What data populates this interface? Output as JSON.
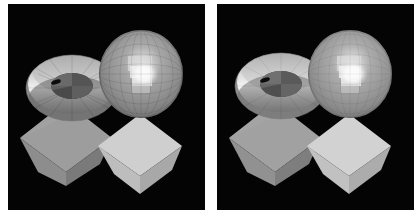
{
  "figure": {
    "background_color": "#ffffff",
    "panel_background_color": "#040404",
    "panel_count": 2,
    "width": 420,
    "height": 221
  },
  "panels": [
    {
      "id": "panel-left",
      "name": "left-render",
      "label": "",
      "x": 8,
      "y": 4,
      "width": 197,
      "height": 206,
      "background": "#040404",
      "shading": "flat-faceted",
      "objects": [
        {
          "name": "torus",
          "label": "torus",
          "center_x": 64,
          "center_y": 84,
          "outer_rx": 46,
          "outer_ry": 33,
          "inner_rx": 21,
          "inner_ry": 13,
          "facet_count": 16,
          "base_color": "#8e8e8e",
          "highlight_color": "#f2f2f2",
          "shadow_color": "#4f4f4f",
          "hole_color": "#5a5a5a"
        },
        {
          "name": "sphere",
          "label": "sphere",
          "center_x": 133,
          "center_y": 70,
          "radius_x": 42,
          "radius_y": 44,
          "facet_rows": 10,
          "facet_cols": 12,
          "base_color": "#8a8a8a",
          "highlight_color": "#f4f4f4",
          "terminator_color": "#5e5e5e",
          "specular_x": 136,
          "specular_y": 72
        },
        {
          "name": "octahedron-left",
          "label": "left diamond",
          "center_x": 58,
          "center_y": 140,
          "half_width": 46,
          "half_height": 42,
          "base_color": "#9a9a9a",
          "left_face_color": "#9d9d9d",
          "right_face_color": "#8a8a8a",
          "bottom_face_color": "#787878"
        },
        {
          "name": "octahedron-right",
          "label": "right diamond",
          "center_x": 132,
          "center_y": 150,
          "half_width": 42,
          "half_height": 40,
          "base_color": "#c8c8c8",
          "left_face_color": "#cfcfcf",
          "right_face_color": "#b4b4b4",
          "bottom_face_color": "#a3a3a3"
        }
      ]
    },
    {
      "id": "panel-right",
      "name": "right-render",
      "label": "",
      "x": 217,
      "y": 4,
      "width": 197,
      "height": 206,
      "background": "#040404",
      "shading": "smooth-interpolated",
      "objects": [
        {
          "name": "torus",
          "label": "torus",
          "center_x": 64,
          "center_y": 82,
          "outer_rx": 46,
          "outer_ry": 33,
          "inner_rx": 21,
          "inner_ry": 13,
          "facet_count": 16,
          "base_color": "#969696",
          "highlight_color": "#f6f6f6",
          "shadow_color": "#565656",
          "hole_color": "#606060"
        },
        {
          "name": "sphere",
          "label": "sphere",
          "center_x": 133,
          "center_y": 70,
          "radius_x": 42,
          "radius_y": 44,
          "facet_rows": 10,
          "facet_cols": 12,
          "base_color": "#8f8f8f",
          "highlight_color": "#f6f6f6",
          "terminator_color": "#636363",
          "specular_x": 136,
          "specular_y": 72
        },
        {
          "name": "octahedron-left",
          "label": "left diamond",
          "center_x": 58,
          "center_y": 140,
          "half_width": 46,
          "half_height": 42,
          "base_color": "#9e9e9e",
          "left_face_color": "#a1a1a1",
          "right_face_color": "#8e8e8e",
          "bottom_face_color": "#7c7c7c"
        },
        {
          "name": "octahedron-right",
          "label": "right diamond",
          "center_x": 132,
          "center_y": 150,
          "half_width": 42,
          "half_height": 40,
          "base_color": "#cccccc",
          "left_face_color": "#d2d2d2",
          "right_face_color": "#b8b8b8",
          "bottom_face_color": "#a7a7a7"
        }
      ]
    }
  ],
  "palette": {
    "white": "#ffffff",
    "black": "#040404",
    "mid_gray": "#8a8a8a",
    "light_gray": "#c8c8c8",
    "highlight": "#f4f4f4",
    "dark_gray": "#4f4f4f"
  }
}
